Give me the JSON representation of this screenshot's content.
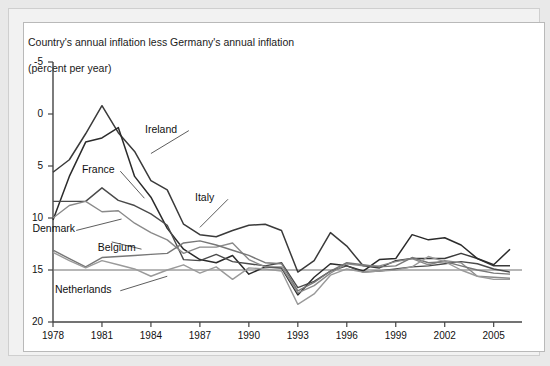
{
  "figure": {
    "title_line1": "Country's annual inflation less Germany's annual inflation",
    "title_line2": "(percent per year)",
    "frame_color": "#b9b9b9",
    "background": "#ffffff"
  },
  "chart_data": {
    "type": "line",
    "title": "Country's annual inflation less Germany's annual inflation (percent per year)",
    "xlabel": "",
    "ylabel": "",
    "xlim": [
      1978,
      2006
    ],
    "ylim": [
      -5,
      20
    ],
    "yticks": [
      -5,
      0,
      5,
      10,
      15,
      20
    ],
    "xticks": [
      1978,
      1981,
      1984,
      1987,
      1990,
      1993,
      1996,
      1999,
      2002,
      2005
    ],
    "grid": false,
    "legend": "inline-annotations",
    "zero_line": true,
    "x": [
      1978,
      1979,
      1980,
      1981,
      1982,
      1983,
      1984,
      1985,
      1986,
      1987,
      1988,
      1989,
      1990,
      1991,
      1992,
      1993,
      1994,
      1995,
      1996,
      1997,
      1998,
      1999,
      2000,
      2001,
      2002,
      2003,
      2004,
      2005,
      2006
    ],
    "series": [
      {
        "name": "Italy",
        "color": "#3a3a3a",
        "width": 1.5,
        "values": [
          9.4,
          10.6,
          13.1,
          15.8,
          13.2,
          11.4,
          8.6,
          7.7,
          4.4,
          3.4,
          3.2,
          3.8,
          4.3,
          4.4,
          3.8,
          -0.2,
          0.9,
          3.6,
          2.3,
          0.4,
          0.2,
          0.9,
          1.1,
          1.1,
          1.1,
          1.6,
          1.1,
          0.4,
          0.4
        ]
      },
      {
        "name": "Ireland",
        "color": "#2b2b2b",
        "width": 1.5,
        "values": [
          4.8,
          9.0,
          12.3,
          12.7,
          13.7,
          9.0,
          7.0,
          4.0,
          2.0,
          1.0,
          0.7,
          1.4,
          -0.4,
          0.3,
          0.2,
          -2.4,
          -0.7,
          0.6,
          0.4,
          -0.1,
          1.0,
          1.1,
          3.4,
          2.9,
          3.1,
          2.4,
          1.1,
          0.5,
          2.0
        ]
      },
      {
        "name": "France",
        "color": "#4a4a4a",
        "width": 1.4,
        "values": [
          6.6,
          6.6,
          6.6,
          7.9,
          6.7,
          6.2,
          5.4,
          4.3,
          1.0,
          0.9,
          1.5,
          0.8,
          0.6,
          0.4,
          0.7,
          -1.7,
          -1.1,
          -0.1,
          0.4,
          -0.2,
          -0.1,
          0.1,
          0.3,
          0.4,
          0.6,
          0.8,
          0.6,
          0.1,
          -0.2
        ]
      },
      {
        "name": "Denmark",
        "color": "#8a8a8a",
        "width": 1.4,
        "values": [
          5.0,
          6.2,
          6.6,
          5.6,
          5.7,
          4.5,
          3.6,
          2.9,
          1.6,
          2.2,
          2.2,
          2.6,
          1.0,
          0.3,
          0.3,
          -2.2,
          -1.5,
          -0.3,
          0.6,
          0.4,
          0.4,
          0.8,
          1.1,
          0.5,
          0.9,
          0.7,
          -0.6,
          -0.7,
          -0.8
        ]
      },
      {
        "name": "Belgium",
        "color": "#777777",
        "width": 1.4,
        "values": [
          1.9,
          1.1,
          0.3,
          1.2,
          1.3,
          1.4,
          1.5,
          1.6,
          2.6,
          2.8,
          2.4,
          1.9,
          1.4,
          0.7,
          0.6,
          -2.0,
          -1.2,
          -0.1,
          0.7,
          0.5,
          0.3,
          0.4,
          1.2,
          0.7,
          0.8,
          0.4,
          0.0,
          -0.3,
          -0.4
        ]
      },
      {
        "name": "Netherlands",
        "color": "#9a9a9a",
        "width": 1.4,
        "values": [
          1.7,
          0.9,
          0.2,
          0.9,
          0.5,
          0.1,
          -0.6,
          0.0,
          0.5,
          -0.3,
          0.3,
          -0.9,
          0.2,
          0.1,
          -0.1,
          -3.3,
          -2.3,
          -0.5,
          0.1,
          -0.2,
          -0.1,
          0.0,
          0.3,
          1.3,
          0.8,
          0.0,
          -0.6,
          -0.9,
          -0.9
        ]
      }
    ],
    "annotations": [
      {
        "text": "Ireland",
        "x": 1986.2,
        "y": 13.5,
        "leader_to_x": 1984.0,
        "leader_to_y": 11.2
      },
      {
        "text": "France",
        "x": 1982.0,
        "y": 9.6,
        "leader_to_x": 1983.6,
        "leader_to_y": 6.9
      },
      {
        "text": "Italy",
        "x": 1988.6,
        "y": 6.9,
        "leader_to_x": 1987.0,
        "leader_to_y": 4.1
      },
      {
        "text": "Denmark",
        "x": 1979.3,
        "y": 3.9,
        "leader_to_x": 1982.2,
        "leader_to_y": 4.9
      },
      {
        "text": "Belgium",
        "x": 1983.3,
        "y": 2.1,
        "leader_to_x": 1981.6,
        "leader_to_y": 2.7
      },
      {
        "text": "Netherlands",
        "x": 1982.0,
        "y": -1.9,
        "leader_to_x": 1985.0,
        "leader_to_y": -0.6
      }
    ]
  },
  "axes": {
    "y_tick_labels": [
      "20",
      "15",
      "10",
      "5",
      "0",
      "-5"
    ],
    "x_tick_labels": [
      "1978",
      "1981",
      "1984",
      "1987",
      "1990",
      "1993",
      "1996",
      "1999",
      "2002",
      "2005"
    ]
  }
}
